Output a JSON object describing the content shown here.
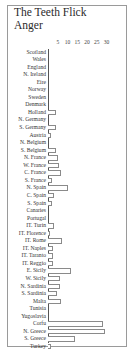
{
  "chart_data": {
    "type": "bar",
    "orientation": "horizontal",
    "title": "The Teeth Flick Anger",
    "xlabel": "",
    "ylabel": "",
    "xlim": [
      0,
      30
    ],
    "x_ticks": [
      5,
      10,
      15,
      20,
      25,
      30
    ],
    "grid": false,
    "legend": null,
    "categories": [
      "Scotland",
      "Wales",
      "England",
      "N. Ireland",
      "Eire",
      "Norway",
      "Sweden",
      "Denmark",
      "Holland",
      "N. Germany",
      "S. Germany",
      "Austria",
      "N. Belgium",
      "S. Belgium",
      "N. France",
      "W. France",
      "C. France",
      "S. France",
      "N. Spain",
      "C. Spain",
      "S. Spain",
      "Canaries",
      "Portugal",
      "IT. Turin",
      "IT. Florence",
      "IT. Rome",
      "IT. Naples",
      "IT. Taranto",
      "IT. Reggio",
      "E. Sicily",
      "W. Sicily",
      "N. Sardinia",
      "S. Sardinia",
      "Malta",
      "Tunisia",
      "Yugoslavia",
      "Corfu",
      "N. Greece",
      "S. Greece",
      "Turkey"
    ],
    "values": [
      0,
      0,
      0,
      0,
      0,
      0,
      0,
      0,
      4,
      0,
      4,
      1.5,
      0,
      4,
      5,
      5.5,
      6.5,
      2,
      10,
      3,
      2,
      0,
      0,
      3,
      1,
      7,
      2.5,
      2.5,
      2.5,
      12,
      6,
      6,
      4.5,
      6.5,
      0,
      0,
      28,
      29,
      14,
      1.5
    ]
  },
  "style": {
    "bar_outline": "#8a8a8a",
    "bar_fill": "#ffffff",
    "frame": "#9a9a9a"
  },
  "scale": {
    "origin_px": 48,
    "px_per_unit": 1.95
  }
}
